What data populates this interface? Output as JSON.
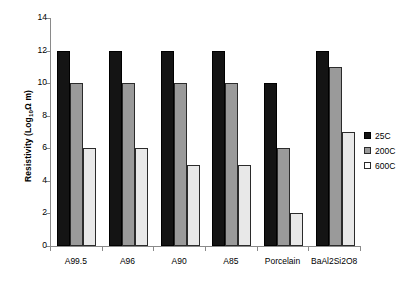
{
  "chart_data": {
    "type": "bar",
    "title": "",
    "xlabel": "",
    "ylabel": "Resistivity (Log10Ω.m)",
    "ylabel_parts": {
      "pre": "Resistivity (Log",
      "sub": "10",
      "post": "Ω m)"
    },
    "categories": [
      "A99.5",
      "A96",
      "A90",
      "A85",
      "Porcelain",
      "BaAl2Si2O8"
    ],
    "series": [
      {
        "name": "25C",
        "color": "#141414",
        "values": [
          12,
          12,
          12,
          12,
          10,
          12
        ]
      },
      {
        "name": "200C",
        "color": "#9a9a9a",
        "values": [
          10,
          10,
          10,
          10,
          6,
          11
        ]
      },
      {
        "name": "600C",
        "color": "#e8e8e8",
        "values": [
          6,
          6,
          5,
          5,
          2,
          7
        ]
      }
    ],
    "ylim": [
      0,
      14
    ],
    "yticks": [
      0,
      2,
      4,
      6,
      8,
      10,
      12,
      14
    ],
    "ytick_labels": [
      "0",
      "2",
      "4",
      "6",
      "8",
      "10",
      "12",
      "14"
    ],
    "grid": false,
    "legend_position": "right",
    "legend_entries": [
      "25C",
      "200C",
      "600C"
    ]
  }
}
